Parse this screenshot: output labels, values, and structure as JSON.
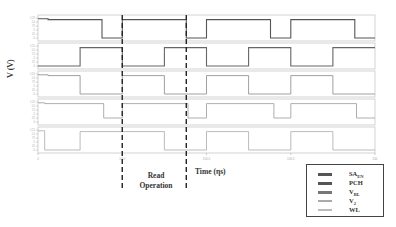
{
  "chart_data": {
    "type": "line",
    "title": "",
    "xlabel": "Time (ηs)",
    "ylabel": "V (V)",
    "xlim": [
      0,
      200
    ],
    "x_ticks": [
      "0",
      "50.0",
      "100.0",
      "150.0",
      "200"
    ],
    "x_tick_values": [
      0,
      50,
      100,
      150,
      200
    ],
    "y_ticks": [
      "0",
      ".25",
      ".5",
      ".75",
      "1.0",
      "1.25"
    ],
    "ylim": [
      0,
      1.25
    ],
    "grid": false,
    "legend_position": "bottom-right",
    "annotation": {
      "text_line1": "Read",
      "text_line2": "Operation",
      "x_start": 50,
      "x_end": 88
    },
    "series": [
      {
        "name": "SA_EN",
        "color": "#555555",
        "points": [
          [
            0,
            1.2
          ],
          [
            6,
            1.2
          ],
          [
            6,
            1.15
          ],
          [
            38,
            1.15
          ],
          [
            38,
            0
          ],
          [
            50,
            0
          ],
          [
            50,
            1.15
          ],
          [
            88,
            1.15
          ],
          [
            88,
            0
          ],
          [
            100,
            0
          ],
          [
            100,
            1.15
          ],
          [
            138,
            1.15
          ],
          [
            138,
            0
          ],
          [
            150,
            0
          ],
          [
            150,
            1.15
          ],
          [
            188,
            1.15
          ],
          [
            188,
            0
          ],
          [
            200,
            0
          ]
        ]
      },
      {
        "name": "PCH",
        "color": "#666666",
        "points": [
          [
            0,
            0
          ],
          [
            25,
            0
          ],
          [
            25,
            1.15
          ],
          [
            50,
            1.15
          ],
          [
            50,
            0
          ],
          [
            75,
            0
          ],
          [
            75,
            1.15
          ],
          [
            100,
            1.15
          ],
          [
            100,
            0
          ],
          [
            125,
            0
          ],
          [
            125,
            1.15
          ],
          [
            150,
            1.15
          ],
          [
            150,
            0
          ],
          [
            175,
            0
          ],
          [
            175,
            1.15
          ],
          [
            200,
            1.15
          ]
        ]
      },
      {
        "name": "V_BL",
        "color": "#888888",
        "points": [
          [
            0,
            1.2
          ],
          [
            6,
            1.2
          ],
          [
            6,
            1.15
          ],
          [
            25,
            1.15
          ],
          [
            25,
            0
          ],
          [
            50,
            0
          ],
          [
            50,
            1.15
          ],
          [
            75,
            1.15
          ],
          [
            75,
            0
          ],
          [
            100,
            0
          ],
          [
            100,
            1.15
          ],
          [
            125,
            1.15
          ],
          [
            125,
            0
          ],
          [
            150,
            0
          ],
          [
            150,
            1.15
          ],
          [
            175,
            1.15
          ],
          [
            175,
            0
          ],
          [
            200,
            0
          ]
        ]
      },
      {
        "name": "V_2",
        "color": "#999999",
        "points": [
          [
            0,
            1.2
          ],
          [
            4,
            1.2
          ],
          [
            4,
            1.15
          ],
          [
            39,
            1.15
          ],
          [
            39,
            0.25
          ],
          [
            50,
            0.25
          ],
          [
            50,
            1.15
          ],
          [
            89,
            1.15
          ],
          [
            89,
            0.25
          ],
          [
            100,
            0.25
          ],
          [
            100,
            1.15
          ],
          [
            140,
            1.15
          ],
          [
            140,
            0.25
          ],
          [
            150,
            0.25
          ],
          [
            150,
            1.15
          ],
          [
            189,
            1.15
          ],
          [
            189,
            0.25
          ],
          [
            200,
            0.25
          ]
        ]
      },
      {
        "name": "WL",
        "color": "#aaaaaa",
        "points": [
          [
            0,
            1.2
          ],
          [
            4,
            1.2
          ],
          [
            4,
            0
          ],
          [
            25,
            0
          ],
          [
            25,
            1.15
          ],
          [
            75,
            1.15
          ],
          [
            75,
            0
          ],
          [
            100,
            0
          ],
          [
            100,
            1.15
          ],
          [
            125,
            1.15
          ],
          [
            125,
            0
          ],
          [
            150,
            0
          ],
          [
            150,
            1.15
          ],
          [
            175,
            1.15
          ],
          [
            175,
            0
          ],
          [
            200,
            0
          ]
        ]
      }
    ]
  },
  "legend": {
    "items": [
      {
        "main": "SA",
        "sub": "EN",
        "color": "#555555"
      },
      {
        "main": "PCH",
        "sub": "",
        "color": "#555555"
      },
      {
        "main": "V",
        "sub": "BL",
        "color": "#777777"
      },
      {
        "main": "V",
        "sub": "2",
        "color": "#aaaaaa"
      },
      {
        "main": "WL",
        "sub": "",
        "color": "#bbbbbb"
      }
    ]
  }
}
